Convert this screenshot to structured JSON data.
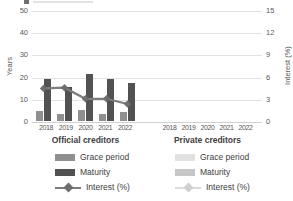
{
  "chart_data": {
    "type": "bar",
    "left_axis": {
      "title": "Years",
      "ticks": [
        0,
        10,
        20,
        30,
        40,
        50
      ],
      "max": 50
    },
    "right_axis": {
      "title": "Interest (%)",
      "ticks": [
        0,
        3,
        6,
        9,
        12,
        15
      ],
      "max": 15
    },
    "categories": [
      "2018",
      "2019",
      "2020",
      "2021",
      "2022"
    ],
    "groups": [
      {
        "label": "Official creditors",
        "series": [
          {
            "name": "Grace period",
            "type": "bar",
            "axis": "left",
            "color": "#8f8f8f",
            "values": [
              4.5,
              3,
              5,
              3,
              4
            ]
          },
          {
            "name": "Maturity",
            "type": "bar",
            "axis": "left",
            "color": "#525252",
            "values": [
              19,
              15.5,
              21,
              19,
              17
            ]
          },
          {
            "name": "Interest (%)",
            "type": "line",
            "axis": "right",
            "color": "#7d7d7d",
            "marker_color": "#6e6e6e",
            "values": [
              4.4,
              4.5,
              3.0,
              3.0,
              2.3
            ]
          }
        ]
      },
      {
        "label": "Private creditors",
        "series": [
          {
            "name": "Grace period",
            "type": "bar",
            "axis": "left",
            "color": "#e1e1e1",
            "values": []
          },
          {
            "name": "Maturity",
            "type": "bar",
            "axis": "left",
            "color": "#c6c6c6",
            "values": []
          },
          {
            "name": "Interest (%)",
            "type": "line",
            "axis": "right",
            "color": "#dadada",
            "marker_color": "#cfcfcf",
            "values": []
          }
        ]
      }
    ],
    "grid": true,
    "legend_position": "bottom"
  },
  "colors": {
    "grid": "#e2e2e2",
    "axis_text": "#595959",
    "label_text": "#404040",
    "background": "#ffffff"
  }
}
